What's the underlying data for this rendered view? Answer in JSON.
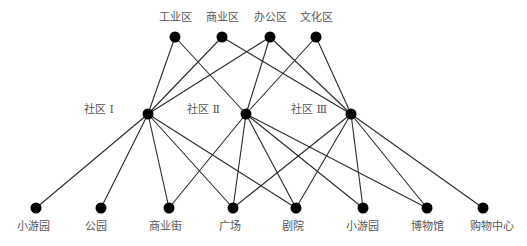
{
  "diagram": {
    "type": "layered-network",
    "layers": {
      "top": [
        {
          "id": "t1",
          "label": "工业区",
          "x": 175,
          "y": 37
        },
        {
          "id": "t2",
          "label": "商业区",
          "x": 222,
          "y": 37
        },
        {
          "id": "t3",
          "label": "办公区",
          "x": 270,
          "y": 37
        },
        {
          "id": "t4",
          "label": "文化区",
          "x": 316,
          "y": 37
        }
      ],
      "middle": [
        {
          "id": "m1",
          "label": "社区 Ⅰ",
          "x": 148,
          "y": 114
        },
        {
          "id": "m2",
          "label": "社区 Ⅱ",
          "x": 246,
          "y": 114
        },
        {
          "id": "m3",
          "label": "社区 Ⅲ",
          "x": 351,
          "y": 114
        }
      ],
      "bottom": [
        {
          "id": "b1",
          "label": "小游园",
          "x": 36,
          "y": 208
        },
        {
          "id": "b2",
          "label": "公园",
          "x": 101,
          "y": 208
        },
        {
          "id": "b3",
          "label": "商业街",
          "x": 169,
          "y": 208
        },
        {
          "id": "b4",
          "label": "广场",
          "x": 233,
          "y": 208
        },
        {
          "id": "b5",
          "label": "剧院",
          "x": 296,
          "y": 208
        },
        {
          "id": "b6",
          "label": "小游园",
          "x": 363,
          "y": 208
        },
        {
          "id": "b7",
          "label": "博物馆",
          "x": 427,
          "y": 208
        },
        {
          "id": "b8",
          "label": "购物中心",
          "x": 483,
          "y": 208
        }
      ]
    },
    "edges": [
      [
        "t1",
        "m1"
      ],
      [
        "t1",
        "m2"
      ],
      [
        "t2",
        "m1"
      ],
      [
        "t2",
        "m3"
      ],
      [
        "t3",
        "m1"
      ],
      [
        "t3",
        "m2"
      ],
      [
        "t3",
        "m3"
      ],
      [
        "t4",
        "m2"
      ],
      [
        "t4",
        "m3"
      ],
      [
        "m1",
        "b1"
      ],
      [
        "m1",
        "b2"
      ],
      [
        "m1",
        "b3"
      ],
      [
        "m1",
        "b4"
      ],
      [
        "m1",
        "b5"
      ],
      [
        "m2",
        "b3"
      ],
      [
        "m2",
        "b4"
      ],
      [
        "m2",
        "b5"
      ],
      [
        "m2",
        "b6"
      ],
      [
        "m2",
        "b7"
      ],
      [
        "m3",
        "b4"
      ],
      [
        "m3",
        "b5"
      ],
      [
        "m3",
        "b6"
      ],
      [
        "m3",
        "b7"
      ],
      [
        "m3",
        "b8"
      ]
    ],
    "colors": {
      "node": "#000000",
      "edge": "#2a2a2a",
      "label": "#555555",
      "background": "#ffffff"
    }
  }
}
